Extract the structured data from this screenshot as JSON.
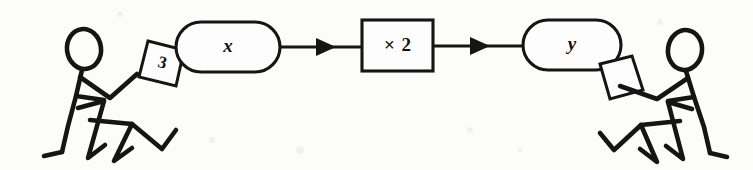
{
  "diagram": {
    "ink_color": "#151515",
    "background_color": "#fcfcfb",
    "input": {
      "card_label": "3",
      "card_name": "input-card"
    },
    "nodes": [
      {
        "id": "x",
        "label": "x",
        "shape": "stadium",
        "role": "input-variable"
      },
      {
        "id": "times2",
        "label": "× 2",
        "shape": "rectangle",
        "role": "operation"
      },
      {
        "id": "y",
        "label": "y",
        "shape": "stadium",
        "role": "output-variable"
      }
    ],
    "arrows": [
      {
        "from": "x",
        "to": "times2"
      },
      {
        "from": "times2",
        "to": "y"
      }
    ],
    "output": {
      "card_label": "",
      "card_name": "output-card"
    },
    "actors": [
      {
        "id": "left",
        "role": "input-giver",
        "pose": "seated, arm extended holding card"
      },
      {
        "id": "right",
        "role": "output-receiver",
        "pose": "seated, arm extended receiving card"
      }
    ]
  }
}
